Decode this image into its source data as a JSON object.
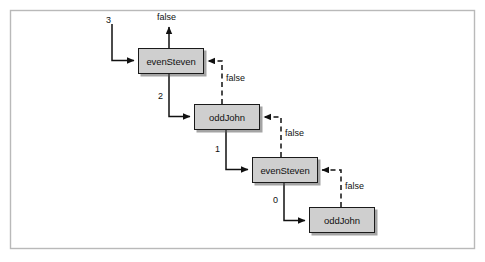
{
  "figure": {
    "kind": "recursion-call-diagram",
    "border_color": "#b8b8b8",
    "background": "#ffffff"
  },
  "style": {
    "box_fill": "#cfcfcf",
    "box_stroke": "#1a1a1a",
    "line_color": "#111111",
    "shadow_color": "#5a5a5a"
  },
  "diagram_data": {
    "type": "diagram",
    "title": "",
    "description": "Mutual recursion trace between evenSteven and oddJohn counting down from 3 to 0, returning false back up the call chain.",
    "nodes": [
      {
        "id": "n1",
        "label": "evenSteven",
        "x": 138,
        "y": 48,
        "w": 66,
        "h": 26
      },
      {
        "id": "n2",
        "label": "oddJohn",
        "x": 194,
        "y": 104,
        "w": 66,
        "h": 26
      },
      {
        "id": "n3",
        "label": "evenSteven",
        "x": 252,
        "y": 157,
        "w": 66,
        "h": 26
      },
      {
        "id": "n4",
        "label": "oddJohn",
        "x": 309,
        "y": 207,
        "w": 66,
        "h": 26
      }
    ],
    "edges": [
      {
        "id": "e-in",
        "label": "3",
        "from": "entry",
        "to": "n1",
        "style": "solid",
        "kind": "call"
      },
      {
        "id": "e-out",
        "label": "false",
        "from": "n1",
        "to": "exit",
        "style": "solid",
        "kind": "return-final"
      },
      {
        "id": "e-12",
        "label": "2",
        "from": "n1",
        "to": "n2",
        "style": "solid",
        "kind": "call"
      },
      {
        "id": "e-21",
        "label": "false",
        "from": "n2",
        "to": "n1",
        "style": "dashed",
        "kind": "return"
      },
      {
        "id": "e-23",
        "label": "1",
        "from": "n2",
        "to": "n3",
        "style": "solid",
        "kind": "call"
      },
      {
        "id": "e-32",
        "label": "false",
        "from": "n3",
        "to": "n2",
        "style": "dashed",
        "kind": "return"
      },
      {
        "id": "e-34",
        "label": "0",
        "from": "n3",
        "to": "n4",
        "style": "solid",
        "kind": "call"
      },
      {
        "id": "e-43",
        "label": "false",
        "from": "n4",
        "to": "n3",
        "style": "dashed",
        "kind": "return"
      }
    ],
    "labels": {
      "entry_arg": "3",
      "final_result": "false",
      "call_args": [
        "2",
        "1",
        "0"
      ],
      "returns": [
        "false",
        "false",
        "false"
      ]
    }
  }
}
